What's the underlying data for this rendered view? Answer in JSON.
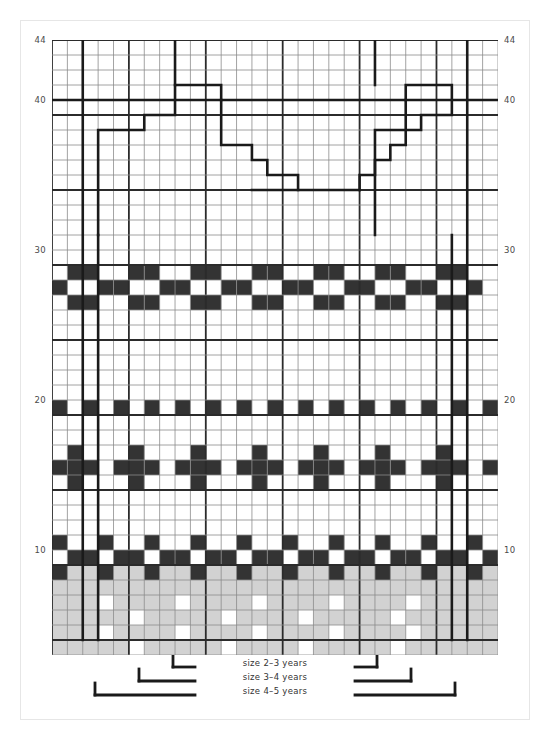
{
  "chart_data": {
    "type": "heatmap",
    "title": "",
    "xlabel": "",
    "ylabel": "",
    "grid": true,
    "columns": 29,
    "rows": 41,
    "row_label_start": 4,
    "x_ticks": [],
    "y_ticks": [
      "10",
      "20",
      "30",
      "40",
      "44"
    ],
    "y_tick_rows": [
      10,
      20,
      30,
      40,
      44
    ],
    "legend_position": "bottom",
    "palette": {
      "background": "#ffffff",
      "dark": "#333333",
      "light_gray": "#d2d2d2",
      "grid_minor": "#8c8c8c",
      "grid_major": "#2b2b2b",
      "outline": "#1a1a1a",
      "axis_text": "#4a4a4a",
      "page_border": "#e6e6e6"
    },
    "dark_cells": [
      [
        29,
        1
      ],
      [
        29,
        2
      ],
      [
        29,
        5
      ],
      [
        29,
        6
      ],
      [
        29,
        9
      ],
      [
        29,
        10
      ],
      [
        29,
        13
      ],
      [
        29,
        14
      ],
      [
        29,
        17
      ],
      [
        29,
        18
      ],
      [
        29,
        21
      ],
      [
        29,
        22
      ],
      [
        29,
        25
      ],
      [
        29,
        26
      ],
      [
        28,
        3
      ],
      [
        28,
        4
      ],
      [
        28,
        7
      ],
      [
        28,
        8
      ],
      [
        28,
        11
      ],
      [
        28,
        12
      ],
      [
        28,
        15
      ],
      [
        28,
        16
      ],
      [
        28,
        19
      ],
      [
        28,
        20
      ],
      [
        28,
        23
      ],
      [
        28,
        24
      ],
      [
        28,
        27
      ],
      [
        28,
        0
      ],
      [
        27,
        1
      ],
      [
        27,
        2
      ],
      [
        27,
        5
      ],
      [
        27,
        6
      ],
      [
        27,
        9
      ],
      [
        27,
        10
      ],
      [
        27,
        13
      ],
      [
        27,
        14
      ],
      [
        27,
        17
      ],
      [
        27,
        18
      ],
      [
        27,
        21
      ],
      [
        27,
        22
      ],
      [
        27,
        25
      ],
      [
        27,
        26
      ],
      [
        20,
        0
      ],
      [
        20,
        2
      ],
      [
        20,
        4
      ],
      [
        20,
        6
      ],
      [
        20,
        8
      ],
      [
        20,
        10
      ],
      [
        20,
        12
      ],
      [
        20,
        14
      ],
      [
        20,
        16
      ],
      [
        20,
        18
      ],
      [
        20,
        20
      ],
      [
        20,
        22
      ],
      [
        20,
        24
      ],
      [
        20,
        26
      ],
      [
        20,
        28
      ],
      [
        17,
        1
      ],
      [
        17,
        5
      ],
      [
        17,
        9
      ],
      [
        17,
        13
      ],
      [
        17,
        17
      ],
      [
        17,
        21
      ],
      [
        17,
        25
      ],
      [
        16,
        0
      ],
      [
        16,
        1
      ],
      [
        16,
        2
      ],
      [
        16,
        4
      ],
      [
        16,
        5
      ],
      [
        16,
        6
      ],
      [
        16,
        8
      ],
      [
        16,
        9
      ],
      [
        16,
        10
      ],
      [
        16,
        12
      ],
      [
        16,
        13
      ],
      [
        16,
        14
      ],
      [
        16,
        16
      ],
      [
        16,
        17
      ],
      [
        16,
        18
      ],
      [
        16,
        20
      ],
      [
        16,
        21
      ],
      [
        16,
        22
      ],
      [
        16,
        24
      ],
      [
        16,
        25
      ],
      [
        16,
        26
      ],
      [
        16,
        28
      ],
      [
        15,
        1
      ],
      [
        15,
        5
      ],
      [
        15,
        9
      ],
      [
        15,
        13
      ],
      [
        15,
        17
      ],
      [
        15,
        21
      ],
      [
        15,
        25
      ],
      [
        11,
        0
      ],
      [
        11,
        3
      ],
      [
        11,
        6
      ],
      [
        11,
        9
      ],
      [
        11,
        12
      ],
      [
        11,
        15
      ],
      [
        11,
        18
      ],
      [
        11,
        21
      ],
      [
        11,
        24
      ],
      [
        11,
        27
      ],
      [
        10,
        1
      ],
      [
        10,
        2
      ],
      [
        10,
        4
      ],
      [
        10,
        5
      ],
      [
        10,
        7
      ],
      [
        10,
        8
      ],
      [
        10,
        10
      ],
      [
        10,
        11
      ],
      [
        10,
        13
      ],
      [
        10,
        14
      ],
      [
        10,
        16
      ],
      [
        10,
        17
      ],
      [
        10,
        19
      ],
      [
        10,
        20
      ],
      [
        10,
        22
      ],
      [
        10,
        23
      ],
      [
        10,
        25
      ],
      [
        10,
        26
      ],
      [
        10,
        28
      ],
      [
        9,
        0
      ],
      [
        9,
        3
      ],
      [
        9,
        6
      ],
      [
        9,
        9
      ],
      [
        9,
        12
      ],
      [
        9,
        15
      ],
      [
        9,
        18
      ],
      [
        9,
        21
      ],
      [
        9,
        24
      ],
      [
        9,
        27
      ]
    ],
    "gray_block": {
      "from_row": 0,
      "to_row": 9,
      "from_col": 0,
      "to_col": 28,
      "color": "#d2d2d2",
      "white_dots": [
        [
          7,
          3
        ],
        [
          7,
          8
        ],
        [
          7,
          13
        ],
        [
          7,
          18
        ],
        [
          7,
          23
        ],
        [
          6,
          5
        ],
        [
          6,
          11
        ],
        [
          6,
          16
        ],
        [
          6,
          22
        ],
        [
          5,
          3
        ],
        [
          5,
          8
        ],
        [
          5,
          13
        ],
        [
          5,
          18
        ],
        [
          5,
          23
        ],
        [
          4,
          5
        ],
        [
          4,
          11
        ],
        [
          4,
          16
        ],
        [
          4,
          22
        ]
      ]
    }
  },
  "axis": {
    "left_labels": [
      {
        "text": "44",
        "row": 44
      },
      {
        "text": "40",
        "row": 40
      },
      {
        "text": "30",
        "row": 30
      },
      {
        "text": "20",
        "row": 20
      },
      {
        "text": "10",
        "row": 10
      }
    ],
    "right_labels": [
      {
        "text": "44",
        "row": 44
      },
      {
        "text": "40",
        "row": 40
      },
      {
        "text": "30",
        "row": 30
      },
      {
        "text": "20",
        "row": 20
      },
      {
        "text": "10",
        "row": 10
      }
    ]
  },
  "legend": {
    "items": [
      {
        "label": "size 2–3 years"
      },
      {
        "label": "size 3–4 years"
      },
      {
        "label": "size 4–5 years"
      }
    ]
  }
}
